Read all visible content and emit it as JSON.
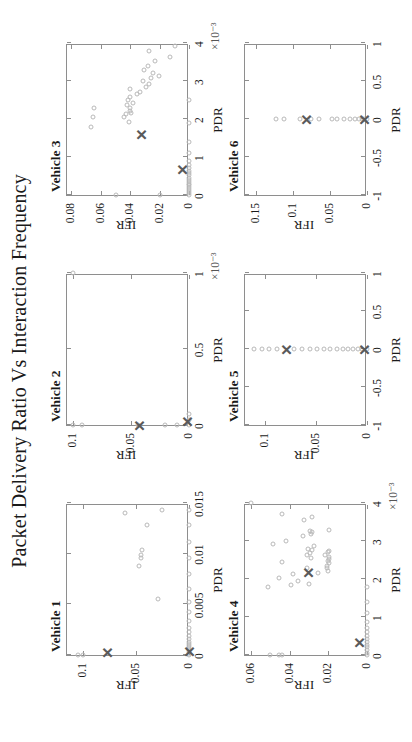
{
  "figure": {
    "title": "Packet Delivery Ratio Vs Interaction Frequency",
    "marker_circle_color": "#b9b9b9",
    "marker_x_color": "#5a5a5a",
    "axis_color": "#8e8e8e",
    "background": "#ffffff",
    "rotation_degrees": -90
  },
  "chart_data": [
    {
      "type": "scatter",
      "title": "Vehicle 1",
      "xlabel": "PDR",
      "ylabel": "IFR",
      "xlim": [
        0,
        0.015
      ],
      "ylim": [
        0,
        0.115
      ],
      "xticks": [
        0,
        0.005,
        0.01,
        0.015
      ],
      "xticklabels": [
        "0",
        "0.005",
        "0.01",
        "0.015"
      ],
      "yticks": [
        0,
        0.05,
        0.1
      ],
      "yticklabels": [
        "0",
        "0.05",
        "0.1"
      ],
      "x_exponent": "",
      "grid": false,
      "series": [
        {
          "name": "observations",
          "marker": "circle",
          "points": [
            [
              0.0,
              0.0
            ],
            [
              0.0001,
              0.0
            ],
            [
              0.0003,
              0.0
            ],
            [
              0.0005,
              0.0
            ],
            [
              0.0007,
              0.0
            ],
            [
              0.0009,
              0.0
            ],
            [
              0.0011,
              0.0
            ],
            [
              0.0013,
              0.0
            ],
            [
              0.0016,
              0.0
            ],
            [
              0.0019,
              0.0
            ],
            [
              0.0023,
              0.0
            ],
            [
              0.0027,
              0.0
            ],
            [
              0.0034,
              0.0
            ],
            [
              0.0042,
              0.0
            ],
            [
              0.0052,
              0.0
            ],
            [
              0.0065,
              0.0
            ],
            [
              0.008,
              0.0
            ],
            [
              0.0096,
              0.0
            ],
            [
              0.0112,
              0.0
            ],
            [
              0.0128,
              0.0
            ],
            [
              0.0143,
              0.0
            ],
            [
              0.0,
              0.105
            ],
            [
              0.0,
              0.1
            ],
            [
              0.0055,
              0.029
            ],
            [
              0.0088,
              0.047
            ],
            [
              0.0096,
              0.045
            ],
            [
              0.0099,
              0.0448
            ],
            [
              0.0104,
              0.044
            ],
            [
              0.0128,
              0.04
            ],
            [
              0.014,
              0.06
            ],
            [
              0.0143,
              0.025
            ]
          ]
        },
        {
          "name": "mean",
          "marker": "x",
          "points": [
            [
              0.0002,
              0.077
            ],
            [
              0.0003,
              0.0
            ]
          ]
        }
      ]
    },
    {
      "type": "scatter",
      "title": "Vehicle 2",
      "xlabel": "PDR",
      "ylabel": "IFR",
      "xlim": [
        0,
        0.001
      ],
      "ylim": [
        0,
        0.105
      ],
      "xticks": [
        0,
        0.0005,
        0.001
      ],
      "xticklabels": [
        "0",
        "0.5",
        "1"
      ],
      "yticks": [
        0,
        0.05,
        0.1
      ],
      "yticklabels": [
        "0",
        "0.05",
        "0.1"
      ],
      "x_exponent": "×10⁻³",
      "grid": false,
      "series": [
        {
          "name": "observations",
          "marker": "circle",
          "points": [
            [
              0.0,
              0.0
            ],
            [
              3e-05,
              0.0
            ],
            [
              7e-05,
              0.0
            ],
            [
              0.0,
              0.01
            ],
            [
              0.0,
              0.021
            ],
            [
              0.0,
              0.044
            ],
            [
              0.0,
              0.092
            ],
            [
              0.0,
              0.1
            ],
            [
              0.001,
              0.1
            ]
          ]
        },
        {
          "name": "mean",
          "marker": "x",
          "points": [
            [
              0.0,
              0.043
            ],
            [
              2e-05,
              0.002
            ]
          ]
        }
      ]
    },
    {
      "type": "scatter",
      "title": "Vehicle 3",
      "xlabel": "PDR",
      "ylabel": "IFR",
      "xlim": [
        0,
        0.004
      ],
      "ylim": [
        0,
        0.083
      ],
      "xticks": [
        0,
        0.001,
        0.002,
        0.003,
        0.004
      ],
      "xticklabels": [
        "0",
        "1",
        "2",
        "3",
        "4"
      ],
      "yticks": [
        0,
        0.02,
        0.04,
        0.06,
        0.08
      ],
      "yticklabels": [
        "0",
        "0.02",
        "0.04",
        "0.06",
        "0.08"
      ],
      "x_exponent": "×10⁻³",
      "grid": false,
      "series": [
        {
          "name": "observations",
          "marker": "circle",
          "points": [
            [
              0.0,
              0.0
            ],
            [
              5e-05,
              0.0
            ],
            [
              0.0001,
              0.0
            ],
            [
              0.00015,
              0.0
            ],
            [
              0.0002,
              0.0
            ],
            [
              0.00025,
              0.0
            ],
            [
              0.0003,
              0.0
            ],
            [
              0.00035,
              0.0
            ],
            [
              0.0004,
              0.0
            ],
            [
              0.00046,
              0.0
            ],
            [
              0.00052,
              0.0
            ],
            [
              0.00058,
              0.0
            ],
            [
              0.00064,
              0.0
            ],
            [
              0.0007,
              0.0
            ],
            [
              0.00078,
              0.0
            ],
            [
              0.0009,
              0.0
            ],
            [
              0.0011,
              0.0
            ],
            [
              0.0014,
              0.0
            ],
            [
              0.0019,
              0.0
            ],
            [
              0.0025,
              0.0
            ],
            [
              0.0,
              0.05
            ],
            [
              0.0,
              0.02
            ],
            [
              0.0018,
              0.067
            ],
            [
              0.00205,
              0.065
            ],
            [
              0.0023,
              0.0645
            ],
            [
              0.00193,
              0.041
            ],
            [
              0.00205,
              0.0445
            ],
            [
              0.00213,
              0.043
            ],
            [
              0.00216,
              0.0395
            ],
            [
              0.00222,
              0.04
            ],
            [
              0.00228,
              0.0398
            ],
            [
              0.00237,
              0.0422
            ],
            [
              0.00243,
              0.038
            ],
            [
              0.0025,
              0.0417
            ],
            [
              0.00257,
              0.04
            ],
            [
              0.00266,
              0.0355
            ],
            [
              0.00272,
              0.033
            ],
            [
              0.00278,
              0.0402
            ],
            [
              0.00285,
              0.0295
            ],
            [
              0.00292,
              0.0275
            ],
            [
              0.003,
              0.031
            ],
            [
              0.00307,
              0.026
            ],
            [
              0.00314,
              0.0205
            ],
            [
              0.0032,
              0.0242
            ],
            [
              0.0033,
              0.0305
            ],
            [
              0.0034,
              0.028
            ],
            [
              0.00352,
              0.023
            ],
            [
              0.00362,
              0.013
            ],
            [
              0.00378,
              0.027
            ],
            [
              0.00392,
              0.0095
            ]
          ]
        },
        {
          "name": "mean",
          "marker": "x",
          "points": [
            [
              0.0016,
              0.0327
            ],
            [
              0.00068,
              0.005
            ]
          ]
        }
      ]
    },
    {
      "type": "scatter",
      "title": "Vehicle 4",
      "xlabel": "PDR",
      "ylabel": "IFR",
      "xlim": [
        0,
        0.004
      ],
      "ylim": [
        0,
        0.063
      ],
      "xticks": [
        0,
        0.001,
        0.002,
        0.003,
        0.004
      ],
      "xticklabels": [
        "0",
        "1",
        "2",
        "3",
        "4"
      ],
      "yticks": [
        0,
        0.02,
        0.04,
        0.06
      ],
      "yticklabels": [
        "0",
        "0.02",
        "0.04",
        "0.06"
      ],
      "x_exponent": "×10⁻³",
      "grid": false,
      "series": [
        {
          "name": "observations",
          "marker": "circle",
          "points": [
            [
              0.0,
              0.0
            ],
            [
              6e-05,
              0.0
            ],
            [
              0.00013,
              0.0
            ],
            [
              0.0002,
              0.0
            ],
            [
              0.00027,
              0.0
            ],
            [
              0.00034,
              0.0
            ],
            [
              0.00042,
              0.0
            ],
            [
              0.0005,
              0.0
            ],
            [
              0.0006,
              0.0
            ],
            [
              0.00072,
              0.0
            ],
            [
              0.00088,
              0.0
            ],
            [
              0.0011,
              0.0
            ],
            [
              0.0014,
              0.0
            ],
            [
              0.0018,
              0.0
            ],
            [
              0.0,
              0.05
            ],
            [
              0.0,
              0.0455
            ],
            [
              0.0,
              0.044
            ],
            [
              0.0018,
              0.051
            ],
            [
              0.00185,
              0.0395
            ],
            [
              0.00188,
              0.03
            ],
            [
              0.00196,
              0.0355
            ],
            [
              0.00203,
              0.0452
            ],
            [
              0.00212,
              0.038
            ],
            [
              0.00216,
              0.0255
            ],
            [
              0.00222,
              0.02
            ],
            [
              0.00228,
              0.0207
            ],
            [
              0.00234,
              0.0205
            ],
            [
              0.00241,
              0.0196
            ],
            [
              0.00248,
              0.02
            ],
            [
              0.00252,
              0.0198
            ],
            [
              0.00258,
              0.0196
            ],
            [
              0.00263,
              0.0218
            ],
            [
              0.0027,
              0.02
            ],
            [
              0.00274,
              0.0198
            ],
            [
              0.00228,
              0.0312
            ],
            [
              0.00244,
              0.044
            ],
            [
              0.00256,
              0.029
            ],
            [
              0.00262,
              0.031
            ],
            [
              0.00268,
              0.0296
            ],
            [
              0.00276,
              0.0285
            ],
            [
              0.0028,
              0.0305
            ],
            [
              0.00286,
              0.0275
            ],
            [
              0.00292,
              0.0485
            ],
            [
              0.003,
              0.042
            ],
            [
              0.00312,
              0.033
            ],
            [
              0.00318,
              0.029
            ],
            [
              0.00323,
              0.0282
            ],
            [
              0.00326,
              0.0296
            ],
            [
              0.0033,
              0.0196
            ],
            [
              0.00355,
              0.0325
            ],
            [
              0.00362,
              0.0285
            ],
            [
              0.00372,
              0.044
            ],
            [
              0.004,
              0.06
            ]
          ]
        },
        {
          "name": "mean",
          "marker": "x",
          "points": [
            [
              0.00218,
              0.0305
            ],
            [
              0.00032,
              0.004
            ]
          ]
        }
      ]
    },
    {
      "type": "scatter",
      "title": "Vehicle 5",
      "xlabel": "PDR",
      "ylabel": "IFR",
      "xlim": [
        -1,
        1
      ],
      "ylim": [
        0,
        0.12
      ],
      "xticks": [
        -1,
        -0.5,
        0,
        0.5,
        1
      ],
      "xticklabels": [
        "-1",
        "-0.5",
        "0",
        "0.5",
        "1"
      ],
      "yticks": [
        0,
        0.05,
        0.1
      ],
      "yticklabels": [
        "0",
        "0.05",
        "0.1"
      ],
      "x_exponent": "",
      "grid": false,
      "series": [
        {
          "name": "observations",
          "marker": "circle",
          "points": [
            [
              0,
              0.0
            ],
            [
              0,
              0.0045
            ],
            [
              0,
              0.009
            ],
            [
              0,
              0.014
            ],
            [
              0,
              0.019
            ],
            [
              0,
              0.024
            ],
            [
              0,
              0.03
            ],
            [
              0,
              0.036
            ],
            [
              0,
              0.042
            ],
            [
              0,
              0.049
            ],
            [
              0,
              0.056
            ],
            [
              0,
              0.064
            ],
            [
              0,
              0.072
            ],
            [
              0,
              0.089
            ],
            [
              0,
              0.096
            ],
            [
              0,
              0.103
            ],
            [
              0,
              0.111
            ]
          ]
        },
        {
          "name": "mean",
          "marker": "x",
          "points": [
            [
              0,
              0.08
            ],
            [
              0,
              0.003
            ]
          ]
        }
      ]
    },
    {
      "type": "scatter",
      "title": "Vehicle 6",
      "xlabel": "PDR",
      "ylabel": "IFR",
      "xlim": [
        -1,
        1
      ],
      "ylim": [
        0,
        0.165
      ],
      "xticks": [
        -1,
        -0.5,
        0,
        0.5,
        1
      ],
      "xticklabels": [
        "-1",
        "-0.5",
        "0",
        "0.5",
        "1"
      ],
      "yticks": [
        0,
        0.05,
        0.1,
        0.15
      ],
      "yticklabels": [
        "0",
        "0.05",
        "0.1",
        "0.15"
      ],
      "x_exponent": "",
      "grid": false,
      "series": [
        {
          "name": "observations",
          "marker": "circle",
          "points": [
            [
              0,
              0.0
            ],
            [
              0,
              0.0035
            ],
            [
              0,
              0.007
            ],
            [
              0,
              0.011
            ],
            [
              0,
              0.016
            ],
            [
              0,
              0.023
            ],
            [
              0,
              0.031
            ],
            [
              0,
              0.04
            ],
            [
              0,
              0.048
            ],
            [
              0,
              0.065
            ],
            [
              0,
              0.076
            ],
            [
              0,
              0.09
            ],
            [
              0,
              0.112
            ],
            [
              0,
              0.123
            ]
          ]
        },
        {
          "name": "mean",
          "marker": "x",
          "points": [
            [
              0,
              0.082
            ],
            [
              0,
              0.0045
            ]
          ]
        }
      ]
    }
  ]
}
